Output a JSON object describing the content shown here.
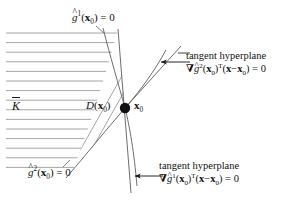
{
  "figure": {
    "kind": "mathematical-diagram",
    "background_color": "#ffffff",
    "ink_color": "#111111",
    "hatch_color": "#8a8a8a",
    "width": 297,
    "height": 202
  },
  "labels": {
    "constraint_curve_1": {
      "g": "g",
      "hat": "^",
      "superscript": "1",
      "arg_open": "(",
      "arg": "x",
      "arg_sub": "0",
      "arg_close": ")",
      "equals": "= 0",
      "plain_text": "g^1(x0) = 0"
    },
    "constraint_curve_2": {
      "g": "g",
      "hat": "^",
      "superscript": "2",
      "arg_open": "(",
      "arg": "x",
      "arg_sub": "0",
      "arg_close": ")",
      "equals": "= 0",
      "plain_text": "g^2(x0) = 0"
    },
    "feasible_set": {
      "symbol": "K",
      "accent": "bar",
      "plain_text": "K-bar"
    },
    "direction_cone": {
      "symbol": "D",
      "arg_open": "(",
      "arg": "x",
      "arg_sub": "0",
      "arg_close": ")",
      "plain_text": "D(x0)"
    },
    "point": {
      "symbol": "x",
      "sub": "0",
      "plain_text": "x0"
    },
    "tangent_hyperplane_upper": {
      "line1": "tangent hyperplane",
      "nabla": "∇",
      "g": "g",
      "hat": "^",
      "superscript": "2",
      "arg_open": "(",
      "arg": "x",
      "arg_sub": "0",
      "arg_close": ")",
      "transpose": "T",
      "expr_open": "(",
      "expr_x": "x",
      "minus": "−",
      "expr_x0": "x",
      "expr_x0_sub": "0",
      "expr_close": ")",
      "equals": "= 0",
      "plain_text": "tangent hyperplane  ∇g^2(x0)^T(x−x0) = 0"
    },
    "tangent_hyperplane_lower": {
      "line1": "tangent hyperplane",
      "nabla": "∇",
      "g": "g",
      "hat": "^",
      "superscript": "1",
      "arg_open": "(",
      "arg": "x",
      "arg_sub": "0",
      "arg_close": ")",
      "transpose": "T",
      "expr_open": "(",
      "expr_x": "x",
      "minus": "−",
      "expr_x0": "x",
      "expr_x0_sub": "0",
      "expr_close": ")",
      "equals": "= 0",
      "plain_text": "tangent hyperplane  ∇g^1(x0)^T(x−x0) = 0"
    }
  },
  "geometry": {
    "point_x0": {
      "x": 125,
      "y": 108,
      "radius": 5
    },
    "horizontal_hatch": {
      "count": 15,
      "y_start": 33,
      "y_step": 9.6,
      "x_left": 6
    },
    "diagonal_hatch": {
      "count": 6
    },
    "leader_arrows": [
      {
        "name": "arrow-upper",
        "from_x": 190,
        "from_y": 62,
        "to_x": 162,
        "to_y": 62
      },
      {
        "name": "arrow-lower",
        "from_x": 163,
        "from_y": 176,
        "to_x": 136,
        "to_y": 176
      }
    ]
  }
}
